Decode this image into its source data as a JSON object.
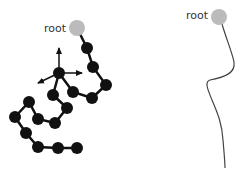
{
  "left_panel": {
    "root_label": "root",
    "root_color": "#bbbbbb",
    "node_color": "#111111",
    "description": "Articulated chain of joints from root with coordinate axes at a branch joint"
  },
  "right_panel": {
    "root_label": "root",
    "root_color": "#bbbbbb",
    "curve_color": "#444444",
    "description": "Smooth curve from root"
  }
}
